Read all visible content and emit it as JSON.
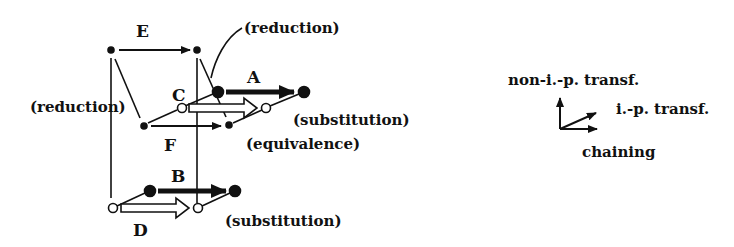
{
  "diagram": {
    "colors": {
      "ink": "#111111",
      "background": "#ffffff"
    },
    "arrows": {
      "E": {
        "label": "E",
        "kind": "chaining"
      },
      "F": {
        "label": "F",
        "kind": "chaining"
      },
      "A": {
        "label": "A",
        "kind": "non-i.-p. transformation"
      },
      "B": {
        "label": "B",
        "kind": "non-i.-p. transformation"
      },
      "C": {
        "label": "C",
        "kind": "i.-p. transformation"
      },
      "D": {
        "label": "D",
        "kind": "i.-p. transformation"
      }
    },
    "annotations": {
      "reduction_top": "(reduction)",
      "reduction_left": "(reduction)",
      "substitution_top": "(substitution)",
      "equivalence": "(equivalence)",
      "substitution_bottom": "(substitution)"
    },
    "legend": {
      "non_ip": "non-i.-p. transf.",
      "ip": "i.-p. transf.",
      "chaining": "chaining"
    }
  }
}
